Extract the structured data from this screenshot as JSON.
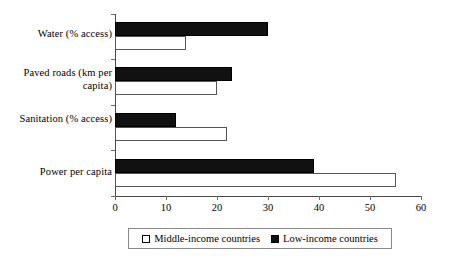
{
  "chart_data": {
    "type": "bar",
    "orientation": "horizontal",
    "title": "",
    "subtitle": "",
    "xlabel": "",
    "ylabel": "",
    "categories": [
      "Water (% access)",
      "Paved roads (km per capita)",
      "Sanitation (% access)",
      "Power per capita"
    ],
    "series": [
      {
        "name": "Middle-income countries",
        "color": "#ffffff",
        "edge_color": "#555555",
        "values": [
          14,
          20,
          22,
          55
        ]
      },
      {
        "name": "Low-income countries",
        "color": "#111111",
        "edge_color": "#000000",
        "values": [
          30,
          23,
          12,
          39
        ]
      }
    ],
    "xlim": [
      0,
      60
    ],
    "xticks": [
      0,
      10,
      20,
      30,
      40,
      50,
      60
    ],
    "xtick_labels": [
      "0",
      "10",
      "20",
      "30",
      "40",
      "50",
      "60"
    ],
    "grid": false,
    "legend_position": "bottom",
    "legend_entries": [
      {
        "label": "Middle-income countries",
        "marker": "open-square"
      },
      {
        "label": "Low-income countries",
        "marker": "filled-square"
      }
    ]
  },
  "axis": {
    "y_axis_line_color": "#4a4a4a",
    "x_axis_line_color": "#4a4a4a",
    "tick_color": "#6a6a6a"
  }
}
